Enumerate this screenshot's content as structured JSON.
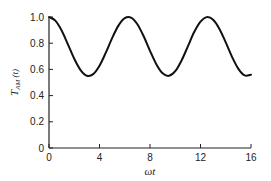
{
  "chart_data": {
    "type": "line",
    "title": "",
    "xlabel": "ωt",
    "ylabel": "T",
    "ylabel_subscript": "AM",
    "ylabel_suffix": " (t)",
    "xlim": [
      0,
      16
    ],
    "ylim": [
      0,
      1.0
    ],
    "xticks": [
      0,
      4,
      8,
      12,
      16
    ],
    "xtick_labels": [
      "0",
      "4",
      "8",
      "12",
      "16"
    ],
    "yticks": [
      0,
      0.2,
      0.4,
      0.6,
      0.8,
      1.0
    ],
    "ytick_labels": [
      "0",
      "0.2",
      "0.4",
      "0.6",
      "0.8",
      "1.0"
    ],
    "grid": false,
    "legend": null,
    "series": [
      {
        "name": "T_AM(t)",
        "color": "#111111",
        "x": [
          0,
          0.5,
          1,
          1.5,
          2,
          2.5,
          3,
          3.5,
          4,
          4.5,
          5,
          5.5,
          6,
          6.5,
          7,
          7.5,
          8,
          8.5,
          9,
          9.5,
          10,
          10.5,
          11,
          11.5,
          12,
          12.5,
          13,
          13.5,
          14,
          14.5,
          15,
          15.5,
          16
        ],
        "y": [
          1.0,
          0.972,
          0.897,
          0.791,
          0.681,
          0.595,
          0.552,
          0.564,
          0.628,
          0.728,
          0.839,
          0.934,
          0.991,
          0.995,
          0.945,
          0.853,
          0.742,
          0.64,
          0.57,
          0.551,
          0.586,
          0.668,
          0.776,
          0.885,
          0.965,
          0.999,
          0.979,
          0.909,
          0.806,
          0.695,
          0.604,
          0.554,
          0.56
        ]
      }
    ]
  }
}
